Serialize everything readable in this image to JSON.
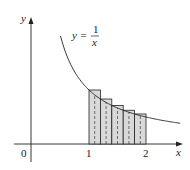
{
  "figure": {
    "curve_label": {
      "lhs": "y =",
      "numerator": "1",
      "denominator": "x"
    },
    "axis_labels": {
      "x": "x",
      "y": "y"
    },
    "ticks": {
      "origin": "0",
      "one": "1",
      "two": "2"
    },
    "rect_fill": "#d9d9d9",
    "stroke_color": "#222222"
  },
  "chart_data": {
    "type": "area",
    "title": "",
    "function": "y = 1/x",
    "xlabel": "x",
    "ylabel": "y",
    "tick_labels": [
      "0",
      "1",
      "2"
    ],
    "rectangles": {
      "interval": [
        1,
        2
      ],
      "n": 5,
      "width": 0.2,
      "left_endpoints": [
        1.0,
        1.2,
        1.4,
        1.6,
        1.8
      ],
      "heights": [
        1.0,
        0.833,
        0.714,
        0.625,
        0.556
      ]
    },
    "grid": false
  }
}
